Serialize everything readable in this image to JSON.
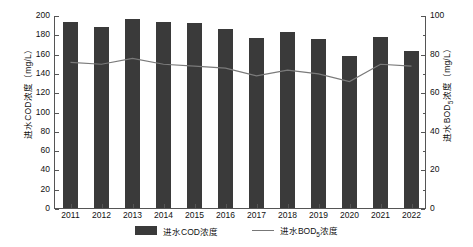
{
  "chart_data": {
    "type": "bar",
    "title": "",
    "xlabel": "",
    "categories": [
      "2011",
      "2012",
      "2013",
      "2014",
      "2015",
      "2016",
      "2017",
      "2018",
      "2019",
      "2020",
      "2021",
      "2022"
    ],
    "grid": false,
    "legend_position": "bottom",
    "series": [
      {
        "name": "进水COD浓度",
        "type": "bar",
        "axis": "left",
        "unit": "mg/L",
        "color": "#3a3a3a",
        "values": [
          193,
          188,
          196,
          193,
          192,
          185,
          176,
          182,
          175,
          158,
          177,
          163
        ]
      },
      {
        "name": "进水BOD5浓度",
        "type": "line",
        "axis": "right",
        "unit": "mg/L",
        "color": "#7a7a7a",
        "values": [
          76,
          75,
          78,
          75,
          74,
          73,
          69,
          72,
          70,
          66,
          75,
          74
        ]
      }
    ],
    "y_left": {
      "label_prefix": "进水COD浓度（mg/L）",
      "min": 0,
      "max": 200,
      "ticks": [
        0,
        20,
        40,
        60,
        80,
        100,
        120,
        140,
        160,
        180,
        200
      ]
    },
    "y_right": {
      "label_prefix": "进水BOD",
      "label_sub": "5",
      "label_suffix": "浓度（mg/L）",
      "min": 0,
      "max": 100,
      "ticks": [
        0,
        20,
        40,
        60,
        80,
        100
      ],
      "minor_ticks": [
        10,
        30,
        50,
        70,
        90
      ]
    }
  },
  "legend": {
    "bar": {
      "label": "进水COD浓度"
    },
    "line": {
      "label_prefix": "进水BOD",
      "label_sub": "5",
      "label_suffix": "浓度"
    }
  }
}
